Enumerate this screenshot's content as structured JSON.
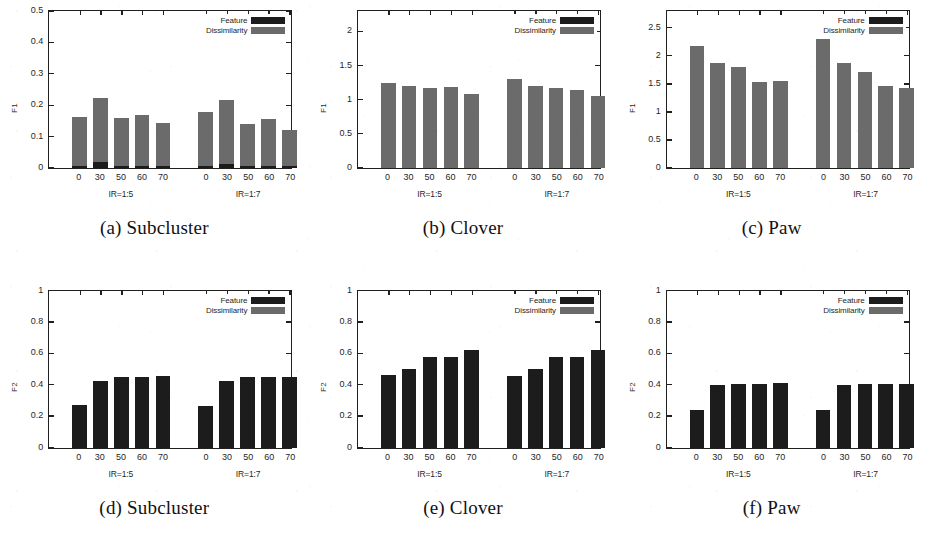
{
  "legend": {
    "feature_label": "Feature",
    "dissimilarity_label": "Dissimilarity",
    "feature_color": "#1c1c1c",
    "dissimilarity_color": "#6b6b6b"
  },
  "group_labels": [
    "IR=1:5",
    "IR=1:7"
  ],
  "panels": [
    {
      "caption": "(a) Subcluster",
      "ylabel": "F1",
      "yticks": [
        0,
        0.1,
        0.2,
        0.3,
        0.4,
        0.5
      ],
      "ytick_labels": [
        "0",
        "0.1",
        "0.2",
        "0.3",
        "0.4",
        "0.5"
      ],
      "ymin": 0,
      "ymax": 0.5
    },
    {
      "caption": "(b) Clover",
      "ylabel": "F1",
      "yticks": [
        0,
        0.5,
        1,
        1.5,
        2
      ],
      "ytick_labels": [
        "0",
        "0.5",
        "1",
        "1.5",
        "2"
      ],
      "ymin": 0,
      "ymax": 2.3
    },
    {
      "caption": "(c) Paw",
      "ylabel": "F1",
      "yticks": [
        0,
        0.5,
        1,
        1.5,
        2,
        2.5
      ],
      "ytick_labels": [
        "0",
        "0.5",
        "1",
        "1.5",
        "2",
        "2.5"
      ],
      "ymin": 0,
      "ymax": 2.8
    },
    {
      "caption": "(d) Subcluster",
      "ylabel": "F2",
      "yticks": [
        0,
        0.2,
        0.4,
        0.6,
        0.8,
        1
      ],
      "ytick_labels": [
        "0",
        "0.2",
        "0.4",
        "0.6",
        "0.8",
        "1"
      ],
      "ymin": 0,
      "ymax": 1
    },
    {
      "caption": "(e) Clover",
      "ylabel": "F2",
      "yticks": [
        0,
        0.2,
        0.4,
        0.6,
        0.8,
        1
      ],
      "ytick_labels": [
        "0",
        "0.2",
        "0.4",
        "0.6",
        "0.8",
        "1"
      ],
      "ymin": 0,
      "ymax": 1
    },
    {
      "caption": "(f) Paw",
      "ylabel": "F2",
      "yticks": [
        0,
        0.2,
        0.4,
        0.6,
        0.8,
        1
      ],
      "ytick_labels": [
        "0",
        "0.2",
        "0.4",
        "0.6",
        "0.8",
        "1"
      ],
      "ymin": 0,
      "ymax": 1
    }
  ],
  "chart_data": [
    {
      "type": "bar",
      "title": "(a) Subcluster",
      "xlabel": "",
      "ylabel": "F1",
      "ylim": [
        0,
        0.5
      ],
      "grid": false,
      "legend_position": "top-right",
      "categories": [
        "0",
        "30",
        "50",
        "60",
        "70",
        "0",
        "30",
        "50",
        "60",
        "70"
      ],
      "groups": [
        "IR=1:5",
        "IR=1:5",
        "IR=1:5",
        "IR=1:5",
        "IR=1:5",
        "IR=1:7",
        "IR=1:7",
        "IR=1:7",
        "IR=1:7",
        "IR=1:7"
      ],
      "series": [
        {
          "name": "Feature",
          "values": [
            0.006,
            0.018,
            0.006,
            0.006,
            0.005,
            0.006,
            0.012,
            0.005,
            0.005,
            0.005
          ]
        },
        {
          "name": "Dissimilarity",
          "values": [
            0.161,
            0.224,
            0.158,
            0.17,
            0.144,
            0.177,
            0.216,
            0.14,
            0.155,
            0.121
          ]
        }
      ]
    },
    {
      "type": "bar",
      "title": "(b) Clover",
      "xlabel": "",
      "ylabel": "F1",
      "ylim": [
        0,
        2.3
      ],
      "grid": false,
      "legend_position": "top-right",
      "categories": [
        "0",
        "30",
        "50",
        "60",
        "70",
        "0",
        "30",
        "50",
        "60",
        "70"
      ],
      "groups": [
        "IR=1:5",
        "IR=1:5",
        "IR=1:5",
        "IR=1:5",
        "IR=1:5",
        "IR=1:7",
        "IR=1:7",
        "IR=1:7",
        "IR=1:7",
        "IR=1:7"
      ],
      "series": [
        {
          "name": "Feature",
          "values": [
            0.0,
            0.0,
            0.0,
            0.0,
            0.0,
            0.0,
            0.0,
            0.0,
            0.0,
            0.0
          ]
        },
        {
          "name": "Dissimilarity",
          "values": [
            1.25,
            1.2,
            1.17,
            1.19,
            1.09,
            1.3,
            1.2,
            1.17,
            1.15,
            1.05
          ]
        }
      ]
    },
    {
      "type": "bar",
      "title": "(c) Paw",
      "xlabel": "",
      "ylabel": "F1",
      "ylim": [
        0,
        2.8
      ],
      "grid": false,
      "legend_position": "top-right",
      "categories": [
        "0",
        "30",
        "50",
        "60",
        "70",
        "0",
        "30",
        "50",
        "60",
        "70"
      ],
      "groups": [
        "IR=1:5",
        "IR=1:5",
        "IR=1:5",
        "IR=1:5",
        "IR=1:5",
        "IR=1:7",
        "IR=1:7",
        "IR=1:7",
        "IR=1:7",
        "IR=1:7"
      ],
      "series": [
        {
          "name": "Feature",
          "values": [
            0.0,
            0.0,
            0.0,
            0.0,
            0.0,
            0.0,
            0.0,
            0.0,
            0.0,
            0.0
          ]
        },
        {
          "name": "Dissimilarity",
          "values": [
            2.17,
            1.87,
            1.81,
            1.54,
            1.55,
            2.3,
            1.88,
            1.72,
            1.46,
            1.43
          ]
        }
      ]
    },
    {
      "type": "bar",
      "title": "(d) Subcluster",
      "xlabel": "",
      "ylabel": "F2",
      "ylim": [
        0,
        1
      ],
      "grid": false,
      "legend_position": "top-right",
      "categories": [
        "0",
        "30",
        "50",
        "60",
        "70",
        "0",
        "30",
        "50",
        "60",
        "70"
      ],
      "groups": [
        "IR=1:5",
        "IR=1:5",
        "IR=1:5",
        "IR=1:5",
        "IR=1:5",
        "IR=1:7",
        "IR=1:7",
        "IR=1:7",
        "IR=1:7",
        "IR=1:7"
      ],
      "series": [
        {
          "name": "Feature",
          "values": [
            0.268,
            0.425,
            0.45,
            0.448,
            0.455,
            0.265,
            0.421,
            0.448,
            0.448,
            0.452
          ]
        },
        {
          "name": "Dissimilarity",
          "values": [
            0.0,
            0.0,
            0.0,
            0.0,
            0.0,
            0.0,
            0.0,
            0.0,
            0.0,
            0.0
          ]
        }
      ]
    },
    {
      "type": "bar",
      "title": "(e) Clover",
      "xlabel": "",
      "ylabel": "F2",
      "ylim": [
        0,
        1
      ],
      "grid": false,
      "legend_position": "top-right",
      "categories": [
        "0",
        "30",
        "50",
        "60",
        "70",
        "0",
        "30",
        "50",
        "60",
        "70"
      ],
      "groups": [
        "IR=1:5",
        "IR=1:5",
        "IR=1:5",
        "IR=1:5",
        "IR=1:5",
        "IR=1:7",
        "IR=1:7",
        "IR=1:7",
        "IR=1:7",
        "IR=1:7"
      ],
      "series": [
        {
          "name": "Feature",
          "values": [
            0.46,
            0.502,
            0.578,
            0.578,
            0.62,
            0.458,
            0.5,
            0.575,
            0.575,
            0.62
          ]
        },
        {
          "name": "Dissimilarity",
          "values": [
            0.0,
            0.0,
            0.0,
            0.0,
            0.0,
            0.0,
            0.0,
            0.0,
            0.0,
            0.0
          ]
        }
      ]
    },
    {
      "type": "bar",
      "title": "(f) Paw",
      "xlabel": "",
      "ylabel": "F2",
      "ylim": [
        0,
        1
      ],
      "grid": false,
      "legend_position": "top-right",
      "categories": [
        "0",
        "30",
        "50",
        "60",
        "70",
        "0",
        "30",
        "50",
        "60",
        "70"
      ],
      "groups": [
        "IR=1:5",
        "IR=1:5",
        "IR=1:5",
        "IR=1:5",
        "IR=1:5",
        "IR=1:7",
        "IR=1:7",
        "IR=1:7",
        "IR=1:7",
        "IR=1:7"
      ],
      "series": [
        {
          "name": "Feature",
          "values": [
            0.24,
            0.4,
            0.405,
            0.405,
            0.41,
            0.24,
            0.398,
            0.403,
            0.405,
            0.405
          ]
        },
        {
          "name": "Dissimilarity",
          "values": [
            0.0,
            0.0,
            0.0,
            0.0,
            0.0,
            0.0,
            0.0,
            0.0,
            0.0,
            0.0
          ]
        }
      ]
    }
  ]
}
